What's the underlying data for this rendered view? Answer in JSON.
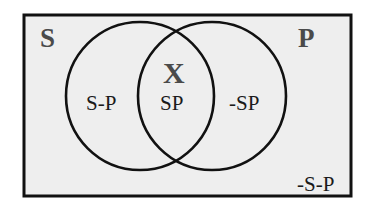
{
  "diagram": {
    "type": "venn",
    "universe": {
      "fill": "#eeeeee",
      "stroke": "#111111"
    },
    "sets": [
      {
        "id": "S",
        "label": "S"
      },
      {
        "id": "P",
        "label": "P"
      }
    ],
    "regions": {
      "s_only": "S-P",
      "intersection": "SP",
      "p_only": "-SP",
      "outside": "-S-P"
    },
    "marker": {
      "region": "intersection",
      "symbol": "X"
    },
    "colors": {
      "set_letter": "#4a4a4a",
      "region_text": "#1a1a1a",
      "circle_stroke": "#111111",
      "background": "#eeeeee"
    }
  }
}
